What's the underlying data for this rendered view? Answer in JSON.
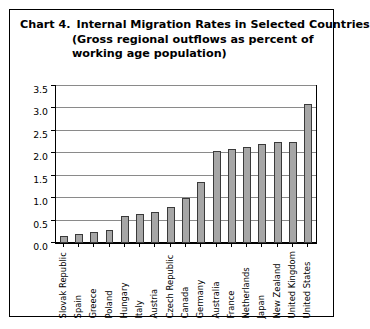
{
  "figure": {
    "chart_number": "Chart 4.",
    "title_line_1": "Internal Migration Rates in Selected Countries",
    "title_line_2": "(Gross regional outflows as percent of",
    "title_line_3": "working age population)"
  },
  "colors": {
    "bar_fill": "#a6a6a6",
    "bar_border": "#3a3a3a",
    "gridline": "#8a8a8a",
    "axis": "#000000",
    "frame": "#000000",
    "background": "#ffffff",
    "text": "#000000"
  },
  "chart_data": {
    "type": "bar",
    "subtitle": "(Gross regional outflows as percent of working age population)",
    "xlabel": "",
    "ylabel": "",
    "ylim": [
      0.0,
      3.5
    ],
    "grid": true,
    "legend": false,
    "orientation": "vertical",
    "y_ticks": [
      0.0,
      0.5,
      1.0,
      1.5,
      2.0,
      2.5,
      3.0,
      3.5
    ],
    "y_tick_labels": [
      "0.0",
      "0.5",
      "1.0",
      "1.5",
      "2.0",
      "2.5",
      "3.0",
      "3.5"
    ],
    "categories": [
      "Slovak Republic",
      "Spain",
      "Greece",
      "Poland",
      "Hungary",
      "Italy",
      "Austria",
      "Czech Republic",
      "Canada",
      "Germany",
      "Australia",
      "France",
      "Netherlands",
      "Japan",
      "New Zealand",
      "United Kingdom",
      "United States"
    ],
    "values": [
      0.15,
      0.2,
      0.25,
      0.3,
      0.6,
      0.65,
      0.7,
      0.8,
      1.0,
      1.35,
      2.05,
      2.1,
      2.15,
      2.2,
      2.25,
      2.25,
      3.1
    ]
  }
}
